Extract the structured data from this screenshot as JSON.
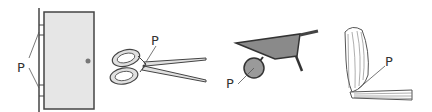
{
  "diagram": {
    "figures": [
      {
        "name": "door",
        "pivot_label": "P",
        "pivot_location": "hinges"
      },
      {
        "name": "scissors",
        "pivot_label": "P",
        "pivot_location": "rivet joint"
      },
      {
        "name": "wheelbarrow",
        "pivot_label": "P",
        "pivot_location": "wheel axle"
      },
      {
        "name": "arm",
        "pivot_label": "P",
        "pivot_location": "elbow"
      }
    ]
  },
  "colors": {
    "line": "#444444",
    "door_fill": "#e6e6e6",
    "metal_fill": "#8a8a8a",
    "scissor_fill": "#e0e0e0",
    "label": "#333333"
  }
}
